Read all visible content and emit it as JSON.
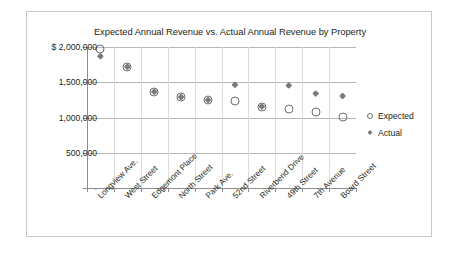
{
  "chart_data": {
    "type": "scatter",
    "title": "Expected Annual Revenue vs. Actual Annual Revenue by Property",
    "xlabel": "",
    "ylabel": "",
    "categories": [
      "Longview Ave.",
      "West Street",
      "Edgemont Place",
      "North Street",
      "Park Ave.",
      "52nd Street",
      "Riverbend Drive",
      "49th Street",
      "7th Avenue",
      "Board Street"
    ],
    "series": [
      {
        "name": "Expected",
        "marker": "open-circle",
        "color": "#6f6f6f",
        "values": [
          1970000,
          1720000,
          1365000,
          1290000,
          1250000,
          1230000,
          1150000,
          1120000,
          1085000,
          1005000
        ]
      },
      {
        "name": "Actual",
        "marker": "filled-diamond",
        "color": "#7a7a7a",
        "values": [
          1870000,
          1720000,
          1365000,
          1290000,
          1250000,
          1465000,
          1155000,
          1455000,
          1340000,
          1305000
        ]
      }
    ],
    "ylim": [
      0,
      2000000
    ],
    "yticks": [
      0,
      500000,
      1000000,
      1500000,
      2000000
    ],
    "ytick_labels": [
      "-",
      "500,000",
      "1,000,000",
      "1,500,000",
      "$  2,000,000"
    ],
    "grid": true,
    "legend_position": "right"
  },
  "legend": {
    "items": [
      {
        "label": "Expected"
      },
      {
        "label": "Actual"
      }
    ]
  }
}
